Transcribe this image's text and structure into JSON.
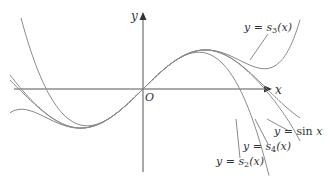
{
  "figure": {
    "axes": {
      "x_label": "x",
      "y_label": "y",
      "origin_label": "O"
    },
    "curves": [
      {
        "id": "sin",
        "label_prefix": "y = ",
        "label_fn": "sin",
        "label_arg": "x",
        "label_text": "y = sin x"
      },
      {
        "id": "s2",
        "label_prefix": "y = ",
        "label_fn": "s",
        "label_sub": "2",
        "label_arg": "(x)",
        "label_text": "y = s2(x)"
      },
      {
        "id": "s3",
        "label_prefix": "y = ",
        "label_fn": "s",
        "label_sub": "3",
        "label_arg": "(x)",
        "label_text": "y = s3(x)"
      },
      {
        "id": "s4",
        "label_prefix": "y = ",
        "label_fn": "s",
        "label_sub": "4",
        "label_arg": "(x)",
        "label_text": "y = s4(x)"
      }
    ],
    "colors": {
      "axis": "#555555",
      "curve": "#8a8a8a",
      "text": "#333333"
    }
  }
}
